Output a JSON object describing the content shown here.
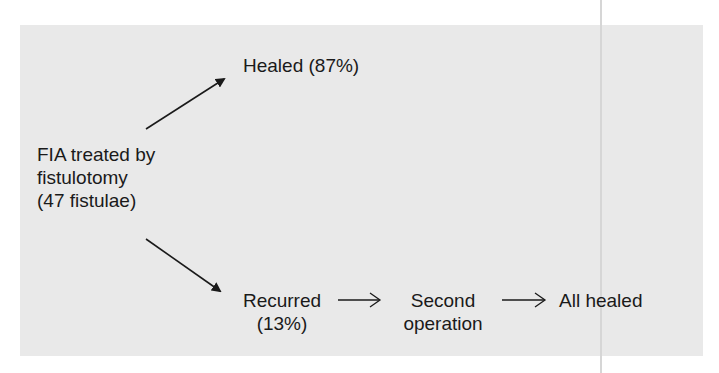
{
  "diagram": {
    "start_node": {
      "line1": "FIA treated by",
      "line2": "fistulotomy",
      "line3": "(47 fistulae)"
    },
    "healed_node": {
      "label": "Healed (87%)"
    },
    "recurred_node": {
      "line1": "Recurred",
      "line2": "(13%)"
    },
    "second_op_node": {
      "line1": "Second",
      "line2": "operation"
    },
    "all_healed_node": {
      "label": "All healed"
    },
    "edges": [
      {
        "from": "start_node",
        "to": "healed_node",
        "style": "solid-arrowhead"
      },
      {
        "from": "start_node",
        "to": "recurred_node",
        "style": "solid-arrowhead"
      },
      {
        "from": "recurred_node",
        "to": "second_op_node",
        "style": "long-right-arrow"
      },
      {
        "from": "second_op_node",
        "to": "all_healed_node",
        "style": "long-right-arrow"
      }
    ]
  },
  "colors": {
    "panel_background": "#e9e9e9",
    "text": "#1a1a1a",
    "arrow": "#1a1a1a"
  }
}
